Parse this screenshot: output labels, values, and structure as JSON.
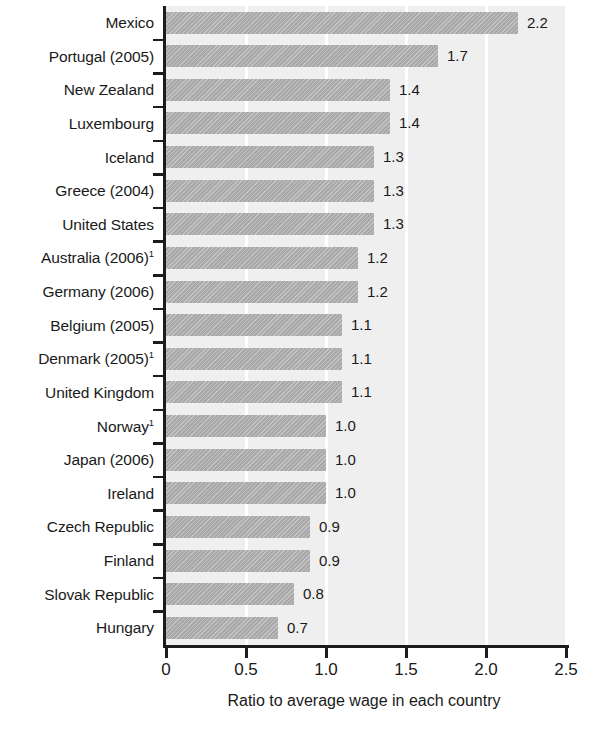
{
  "chart_data": {
    "type": "bar",
    "orientation": "horizontal",
    "title": "",
    "xlabel": "Ratio to average wage in each country",
    "ylabel": "",
    "xlim": [
      0,
      2.5
    ],
    "xticks": [
      "0",
      "0.5",
      "1.0",
      "1.5",
      "2.0",
      "2.5"
    ],
    "xtick_values": [
      0,
      0.5,
      1.0,
      1.5,
      2.0,
      2.5
    ],
    "grid": "vertical-white-gridlines",
    "legend": "none",
    "categories": [
      "Mexico",
      "Portugal (2005)",
      "New Zealand",
      "Luxembourg",
      "Iceland",
      "Greece (2004)",
      "United States",
      "Australia (2006)",
      "Germany (2006)",
      "Belgium (2005)",
      "Denmark (2005)",
      "United Kingdom",
      "Norway",
      "Japan (2006)",
      "Ireland",
      "Czech Republic",
      "Finland",
      "Slovak Republic",
      "Hungary"
    ],
    "category_footnotes": [
      "",
      "",
      "",
      "",
      "",
      "",
      "",
      "1",
      "",
      "",
      "1",
      "",
      "1",
      "",
      "",
      "",
      "",
      "",
      ""
    ],
    "values": [
      2.2,
      1.7,
      1.4,
      1.4,
      1.3,
      1.3,
      1.3,
      1.2,
      1.2,
      1.1,
      1.1,
      1.1,
      1.0,
      1.0,
      1.0,
      0.9,
      0.9,
      0.8,
      0.7
    ],
    "value_labels": [
      "2.2",
      "1.7",
      "1.4",
      "1.4",
      "1.3",
      "1.3",
      "1.3",
      "1.2",
      "1.2",
      "1.1",
      "1.1",
      "1.1",
      "1.0",
      "1.0",
      "1.0",
      "0.9",
      "0.9",
      "0.8",
      "0.7"
    ],
    "colors": {
      "bar": "#a9a9a9",
      "plot_background": "#f0efef",
      "gridline": "#ffffff",
      "axis": "#1c1c1c",
      "text": "#1a1a1a",
      "page_background": "#ffffff"
    }
  }
}
